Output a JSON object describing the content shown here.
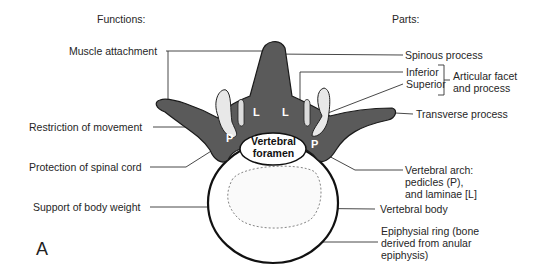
{
  "headers": {
    "functions": "Functions:",
    "parts": "Parts:"
  },
  "functions": [
    {
      "label": "Muscle attachment"
    },
    {
      "label": "Restriction of movement"
    },
    {
      "label": "Protection of spinal cord"
    },
    {
      "label": "Support of body weight"
    }
  ],
  "parts": {
    "spinous": "Spinous process",
    "inferior": "Inferior",
    "superior": "Superior",
    "articular": "Articular facet\nand process",
    "transverse": "Transverse process",
    "arch": "Vertebral arch:\npedicles (P),\nand laminae [L]",
    "body": "Vertebral body",
    "ring": "Epiphysial ring (bone\nderived from anular\nepiphysis)"
  },
  "diagram_labels": {
    "foramen": "Vertebral\nforamen",
    "lamina": "L",
    "pedicle": "P"
  },
  "figure_letter": "A",
  "colors": {
    "bone_arch": "#5a5a5a",
    "bone_dark": "#3a3a3a",
    "facet": "#e8e8e8",
    "line": "#333333"
  }
}
